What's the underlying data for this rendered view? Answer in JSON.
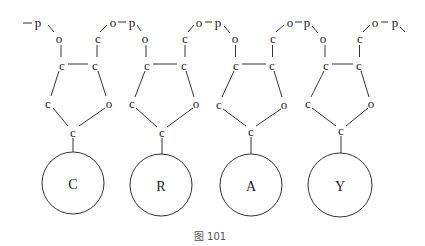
{
  "figure": {
    "caption": "图 101",
    "chain_start": {
      "atom": "p"
    },
    "units": [
      {
        "base": "C",
        "top_o": "o",
        "left_c": "c",
        "right_c": "c",
        "top_c": "c",
        "link_o": "o",
        "link_p": "p",
        "lower_left_c": "c",
        "ring_o": "o",
        "bottom_c": "c"
      },
      {
        "base": "R",
        "top_o": "o",
        "left_c": "c",
        "right_c": "c",
        "top_c": "c",
        "link_o": "o",
        "link_p": "p",
        "lower_left_c": "c",
        "ring_o": "o",
        "bottom_c": "c"
      },
      {
        "base": "A",
        "top_o": "o",
        "left_c": "c",
        "right_c": "c",
        "top_c": "c",
        "link_o": "o",
        "link_p": "p",
        "lower_left_c": "c",
        "ring_o": "o",
        "bottom_c": "c"
      },
      {
        "base": "Y",
        "top_o": "o",
        "left_c": "c",
        "right_c": "c",
        "top_c": "c",
        "link_o": "o",
        "link_p": "p",
        "lower_left_c": "c",
        "ring_o": "o",
        "bottom_c": "c"
      }
    ]
  }
}
